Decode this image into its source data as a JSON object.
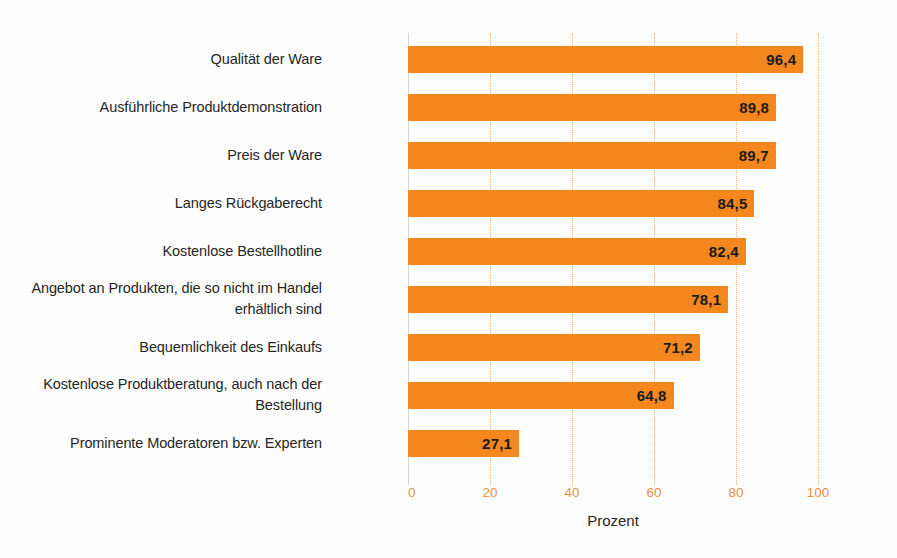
{
  "chart_data": {
    "type": "bar",
    "orientation": "horizontal",
    "title": "",
    "subtitle": "",
    "xlabel": "Prozent",
    "ylabel": "",
    "xlim": [
      0,
      100
    ],
    "xticks": [
      "0",
      "20",
      "40",
      "60",
      "80",
      "100"
    ],
    "xtick_values": [
      0,
      20,
      40,
      60,
      80,
      100
    ],
    "grid": "vertical dotted",
    "legend": "none",
    "value_label_format": "comma-decimal",
    "categories": [
      "Qualität der Ware",
      "Ausführliche Produktdemonstration",
      "Preis der Ware",
      "Langes Rückgaberecht",
      "Kostenlose Bestellhotline",
      "Angebot an Produkten, die so nicht im Handel\nerhältlich sind",
      "Bequemlichkeit des Einkaufs",
      "Kostenlose Produktberatung, auch nach der\nBestellung",
      "Prominente Moderatoren bzw. Experten"
    ],
    "values": [
      96.4,
      89.8,
      89.7,
      84.5,
      82.4,
      78.1,
      71.2,
      64.8,
      27.1
    ],
    "value_labels": [
      "96,4",
      "89,8",
      "89,7",
      "84,5",
      "82,4",
      "78,1",
      "71,2",
      "64,8",
      "27,1"
    ],
    "colors": {
      "bar": "#f5871f",
      "gridline": "#f0b477",
      "axis": "#d8d3cd",
      "tick_label": "#e8904a",
      "category_label": "#262626",
      "value_label": "#1a1a1a",
      "background": "#fdfdfd"
    }
  }
}
